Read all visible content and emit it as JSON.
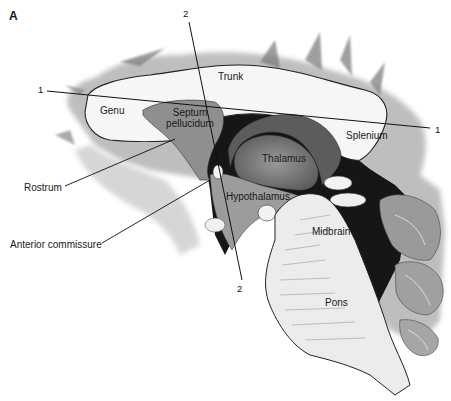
{
  "figure": {
    "panel_label": "A",
    "colors": {
      "background": "#ffffff",
      "white_matter": "#f4f4f4",
      "gray_tissue": "#a8a8a8",
      "dark_cavity": "#161616",
      "outline": "#222222"
    }
  },
  "labels": {
    "trunk": "Trunk",
    "genu": "Genu",
    "septum_line1": "Septum",
    "septum_line2": "pellucidum",
    "splenium": "Splenium",
    "thalamus": "Thalamus",
    "hypothalamus": "Hypothalamus",
    "midbrain": "Midbrain",
    "pons": "Pons",
    "rostrum": "Rostrum",
    "anterior_commissure": "Anterior commissure"
  },
  "section_lines": [
    {
      "id": "1",
      "start_label": "1",
      "end_label": "1"
    },
    {
      "id": "2",
      "start_label": "2",
      "end_label": "2"
    }
  ]
}
